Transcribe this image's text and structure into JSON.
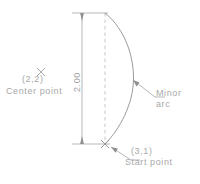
{
  "drawing": {
    "title": "Arc definition drawing",
    "stroke_color": "#9a9a9a",
    "text_color": "#a8a8a8",
    "background": "#ffffff",
    "annotations": {
      "center_marker_icon": "x-marker-icon",
      "center_coordinate": "(2,2)",
      "center_caption": "Center  point",
      "dimension_value": "2.00",
      "minor_label_line1": "Minor",
      "minor_label_line2": "arc",
      "start_coordinate": "(3,1)",
      "start_caption": "Start  point",
      "start_marker_icon": "x-marker-icon"
    },
    "geometry": {
      "chord_style": "dashed",
      "chord_x": 105,
      "chord_top_y": 13,
      "chord_bottom_y": 144,
      "arc_bulge_x": 133,
      "dimension_line_x": 82,
      "arc_type": "minor"
    }
  }
}
